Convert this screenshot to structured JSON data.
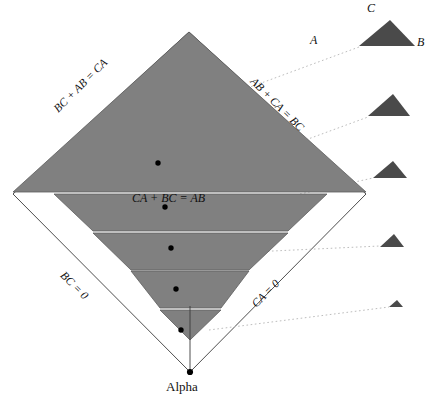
{
  "figure": {
    "colors": {
      "band_fill": "#808080",
      "band_stroke": "#5d5d5d",
      "small_triangle_fill": "#4a4a4a",
      "outline": "#3a3a3a",
      "leader_line": "#bdbdbd",
      "dot": "#000000",
      "background": "#ffffff"
    },
    "edge_labels": {
      "upper_left": "BC + AB = CA",
      "upper_right": "AB + CA = BC",
      "lower_left": "BC = 0",
      "lower_right": "CA = 0"
    },
    "center_label": "CA + BC = AB",
    "bottom_vertex_label": "Alpha",
    "key_triangle_vertices": {
      "left": "A",
      "right": "B",
      "apex": "C"
    },
    "diamond": {
      "apex": [
        189,
        32
      ],
      "left": [
        13,
        194
      ],
      "right": [
        366,
        194
      ],
      "bottom": [
        190,
        372
      ]
    },
    "bands": [
      {
        "name": "band-1",
        "top_y": 32,
        "bottom_y": 192,
        "left_x": 13,
        "right_x": 366,
        "shape": "triangle",
        "dot": [
          158,
          163
        ]
      },
      {
        "name": "band-2",
        "top_y": 194,
        "bottom_y": 231,
        "left_x": 54,
        "right_x": 327,
        "shape": "trapezoid",
        "dot": [
          165,
          207
        ]
      },
      {
        "name": "band-3",
        "top_y": 233,
        "bottom_y": 270,
        "left_x": 93,
        "right_x": 288,
        "shape": "trapezoid",
        "dot": [
          171,
          248
        ]
      },
      {
        "name": "band-4",
        "top_y": 271,
        "bottom_y": 308,
        "left_x": 130,
        "right_x": 249,
        "shape": "trapezoid",
        "dot": [
          176,
          289
        ]
      },
      {
        "name": "band-5",
        "top_y": 310,
        "bottom_y": 340,
        "left_x": 160,
        "right_x": 221,
        "shape": "triangle",
        "dot": [
          181,
          330
        ]
      }
    ],
    "small_triangles": [
      {
        "name": "key-triangle",
        "cx": 387,
        "base_y": 46,
        "half_width": 28,
        "height": 26,
        "apex_offset": 3,
        "labeled": true
      },
      {
        "name": "sample-triangle-2",
        "cx": 389,
        "base_y": 116,
        "half_width": 21,
        "height": 22,
        "apex_offset": 4
      },
      {
        "name": "sample-triangle-3",
        "cx": 390,
        "base_y": 178,
        "half_width": 17,
        "height": 17,
        "apex_offset": 3
      },
      {
        "name": "sample-triangle-4",
        "cx": 392,
        "base_y": 247,
        "half_width": 12,
        "height": 13,
        "apex_offset": 2
      },
      {
        "name": "sample-triangle-5",
        "cx": 396,
        "base_y": 307,
        "half_width": 7,
        "height": 7,
        "apex_offset": 1
      }
    ],
    "leader_lines": [
      {
        "name": "leader-1",
        "from": [
          188,
          110
        ],
        "to": [
          359,
          47
        ]
      },
      {
        "name": "leader-2",
        "from": [
          243,
          163
        ],
        "to": [
          368,
          117
        ]
      },
      {
        "name": "leader-3",
        "from": [
          300,
          194
        ],
        "to": [
          373,
          178
        ]
      },
      {
        "name": "leader-4",
        "from": [
          230,
          253
        ],
        "to": [
          380,
          246
        ]
      },
      {
        "name": "leader-5",
        "from": [
          209,
          330
        ],
        "to": [
          389,
          307
        ]
      }
    ],
    "alpha_point": [
      190,
      372
    ]
  }
}
